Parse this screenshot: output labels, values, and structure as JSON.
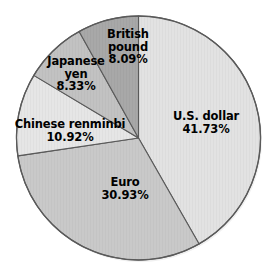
{
  "chart_data": {
    "type": "pie",
    "title": "",
    "subtitle": "",
    "xlabel": "",
    "ylabel": "",
    "legend_position": "none",
    "grid": false,
    "start_angle_deg": 0,
    "direction": "clockwise",
    "units": "percent",
    "categories": [
      "U.S. dollar",
      "Euro",
      "Chinese renminbi",
      "Japanese yen",
      "British pound"
    ],
    "values": [
      41.73,
      30.93,
      10.92,
      8.33,
      8.09
    ],
    "value_labels": [
      "41.73%",
      "30.93%",
      "10.92%",
      "8.33%",
      "8.09%"
    ],
    "colors": [
      "#e2e2e2",
      "#c9c9c9",
      "#e6e6e6",
      "#c2c2c2",
      "#a8a8a8"
    ],
    "slices": [
      {
        "name": "U.S. dollar",
        "value": 41.73,
        "value_label": "41.73%",
        "color": "#e2e2e2",
        "start_deg": 0.0,
        "sweep_deg": 150.23
      },
      {
        "name": "Euro",
        "value": 30.93,
        "value_label": "30.93%",
        "color": "#c9c9c9",
        "start_deg": 150.23,
        "sweep_deg": 111.35
      },
      {
        "name": "Chinese renminbi",
        "value": 10.92,
        "value_label": "10.92%",
        "color": "#e6e6e6",
        "start_deg": 261.58,
        "sweep_deg": 39.31
      },
      {
        "name": "Japanese yen",
        "value": 8.33,
        "value_label": "8.33%",
        "color": "#c2c2c2",
        "start_deg": 300.89,
        "sweep_deg": 29.99
      },
      {
        "name": "British pound",
        "value": 8.09,
        "value_label": "8.09%",
        "color": "#a8a8a8",
        "start_deg": 330.88,
        "sweep_deg": 29.12
      }
    ]
  },
  "labels": {
    "usd": {
      "name": "U.S. dollar",
      "value": "41.73%"
    },
    "eur": {
      "name": "Euro",
      "value": "30.93%"
    },
    "cny": {
      "name": "Chinese renminbi",
      "value": "10.92%"
    },
    "jpy_line1": "Japanese",
    "jpy_line2": "yen",
    "jpy_value": "8.33%",
    "gbp_line1": "British",
    "gbp_line2": "pound",
    "gbp_value": "8.09%"
  },
  "style": {
    "background": "#ffffff",
    "outline": "#5a5a5a",
    "text": "#000000"
  }
}
